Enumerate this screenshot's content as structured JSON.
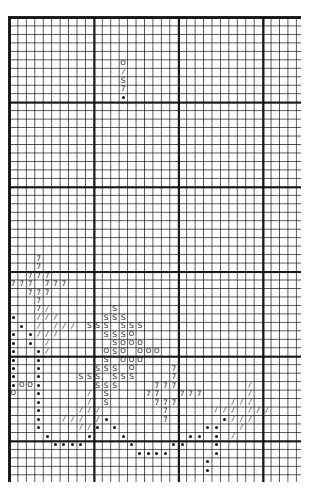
{
  "chart": {
    "columns": 35,
    "rows": 55,
    "cell_width": 8.45,
    "cell_height": 8.47,
    "grid_line_color": "#222222",
    "bold_line_every": 10
  },
  "legend": {
    "column": 13,
    "start_row": 5,
    "symbols": [
      "O",
      "/",
      "S",
      "7",
      "•"
    ]
  },
  "symbols": {
    "O": "O",
    "/": "/",
    "S": "S",
    "7": "7",
    "•": "dot"
  },
  "stitches": [
    {
      "r": 28,
      "s": "7",
      "c": [
        3
      ]
    },
    {
      "r": 29,
      "s": "7",
      "c": [
        3
      ]
    },
    {
      "r": 30,
      "s": "7",
      "c": [
        2,
        3,
        4
      ]
    },
    {
      "r": 31,
      "s": "7",
      "c": [
        0,
        1,
        2,
        4,
        5,
        6
      ]
    },
    {
      "r": 32,
      "s": "7",
      "c": [
        2,
        3,
        4
      ]
    },
    {
      "r": 33,
      "s": "7",
      "c": [
        3
      ]
    },
    {
      "r": 34,
      "s": "7",
      "c": [
        3
      ]
    },
    {
      "r": 34,
      "s": "/",
      "c": [
        4
      ]
    },
    {
      "r": 34,
      "s": "S",
      "c": [
        12
      ]
    },
    {
      "r": 35,
      "s": "•",
      "c": [
        0
      ]
    },
    {
      "r": 35,
      "s": "/",
      "c": [
        3,
        4,
        5
      ]
    },
    {
      "r": 35,
      "s": "S",
      "c": [
        11,
        12,
        13
      ]
    },
    {
      "r": 36,
      "s": "•",
      "c": [
        1
      ]
    },
    {
      "r": 36,
      "s": "/",
      "c": [
        3,
        5,
        6,
        7
      ]
    },
    {
      "r": 36,
      "s": "S",
      "c": [
        9,
        10,
        11,
        13,
        14,
        15
      ]
    },
    {
      "r": 37,
      "s": "•",
      "c": [
        0,
        2
      ]
    },
    {
      "r": 37,
      "s": "/",
      "c": [
        3,
        4,
        5
      ]
    },
    {
      "r": 37,
      "s": "S",
      "c": [
        11,
        12,
        13
      ]
    },
    {
      "r": 37,
      "s": "O",
      "c": [
        14
      ]
    },
    {
      "r": 38,
      "s": "•",
      "c": [
        0,
        2
      ]
    },
    {
      "r": 38,
      "s": "/",
      "c": [
        4
      ]
    },
    {
      "r": 38,
      "s": "S",
      "c": [
        12
      ]
    },
    {
      "r": 38,
      "s": "O",
      "c": [
        13,
        14,
        15
      ]
    },
    {
      "r": 39,
      "s": "•",
      "c": [
        0,
        3
      ]
    },
    {
      "r": 39,
      "s": "/",
      "c": [
        4
      ]
    },
    {
      "r": 39,
      "s": "O",
      "c": [
        11,
        13,
        15,
        16,
        17
      ]
    },
    {
      "r": 39,
      "s": "S",
      "c": [
        12
      ]
    },
    {
      "r": 40,
      "s": "•",
      "c": [
        0,
        3
      ]
    },
    {
      "r": 40,
      "s": "S",
      "c": [
        11
      ]
    },
    {
      "r": 40,
      "s": "O",
      "c": [
        13,
        14,
        15
      ]
    },
    {
      "r": 41,
      "s": "•",
      "c": [
        0,
        3
      ]
    },
    {
      "r": 41,
      "s": "S",
      "c": [
        10,
        11,
        12
      ]
    },
    {
      "r": 41,
      "s": "O",
      "c": [
        14
      ]
    },
    {
      "r": 41,
      "s": "7",
      "c": [
        19
      ]
    },
    {
      "r": 42,
      "s": "•",
      "c": [
        0,
        3
      ]
    },
    {
      "r": 42,
      "s": "S",
      "c": [
        8,
        9,
        10,
        12,
        13,
        14
      ]
    },
    {
      "r": 42,
      "s": "7",
      "c": [
        19
      ]
    },
    {
      "r": 43,
      "s": "•",
      "c": [
        0,
        3
      ]
    },
    {
      "r": 43,
      "s": "O",
      "c": [
        1,
        2
      ]
    },
    {
      "r": 43,
      "s": "S",
      "c": [
        10,
        11,
        12
      ]
    },
    {
      "r": 43,
      "s": "7",
      "c": [
        17,
        18,
        19
      ]
    },
    {
      "r": 43,
      "s": "/",
      "c": [
        28
      ]
    },
    {
      "r": 44,
      "s": "O",
      "c": [
        0
      ]
    },
    {
      "r": 44,
      "s": "•",
      "c": [
        3
      ]
    },
    {
      "r": 44,
      "s": "/",
      "c": [
        9,
        28
      ]
    },
    {
      "r": 44,
      "s": "S",
      "c": [
        11
      ]
    },
    {
      "r": 44,
      "s": "7",
      "c": [
        16,
        17,
        20,
        21,
        22
      ]
    },
    {
      "r": 45,
      "s": "•",
      "c": [
        3
      ]
    },
    {
      "r": 45,
      "s": "/",
      "c": [
        9,
        26,
        27,
        28
      ]
    },
    {
      "r": 45,
      "s": "S",
      "c": [
        11
      ]
    },
    {
      "r": 45,
      "s": "7",
      "c": [
        17,
        18,
        19
      ]
    },
    {
      "r": 46,
      "s": "•",
      "c": [
        3
      ]
    },
    {
      "r": 46,
      "s": "/",
      "c": [
        8,
        9,
        10,
        24,
        25,
        26,
        28,
        29,
        30
      ]
    },
    {
      "r": 46,
      "s": "7",
      "c": [
        18
      ]
    },
    {
      "r": 47,
      "s": "•",
      "c": [
        3,
        11,
        25
      ]
    },
    {
      "r": 47,
      "s": "/",
      "c": [
        6,
        7,
        8,
        10,
        26,
        27,
        28
      ]
    },
    {
      "r": 47,
      "s": "7",
      "c": [
        18
      ]
    },
    {
      "r": 48,
      "s": "•",
      "c": [
        3,
        10,
        12,
        23,
        24
      ]
    },
    {
      "r": 48,
      "s": "/",
      "c": [
        8,
        9,
        27
      ]
    },
    {
      "r": 49,
      "s": "•",
      "c": [
        4,
        9,
        13,
        21,
        22,
        24
      ]
    },
    {
      "r": 49,
      "s": "/",
      "c": [
        26
      ]
    },
    {
      "r": 50,
      "s": "•",
      "c": [
        5,
        6,
        7,
        8,
        14,
        19,
        20,
        24
      ]
    },
    {
      "r": 51,
      "s": "•",
      "c": [
        15,
        16,
        17,
        18,
        24
      ]
    },
    {
      "r": 52,
      "s": "•",
      "c": [
        23
      ]
    },
    {
      "r": 53,
      "s": "•",
      "c": [
        23
      ]
    }
  ]
}
